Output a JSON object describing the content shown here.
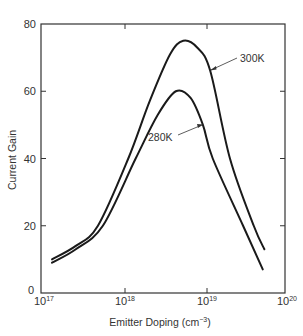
{
  "chart_data": {
    "type": "line",
    "title": "",
    "xlabel": "Emitter Doping (cm⁻³)",
    "xlabel_text": "Emitter Doping (cm",
    "xlabel_sup": "−3",
    "xlabel_close": ")",
    "ylabel": "Current Gain",
    "xscale": "log",
    "xlim": [
      1e+17,
      1e+20
    ],
    "ylim": [
      0,
      80
    ],
    "grid": false,
    "legend": "none (curves labelled by annotation arrows)",
    "x_ticks": [
      {
        "base": "10",
        "exp": "17",
        "value": 1e+17
      },
      {
        "base": "10",
        "exp": "18",
        "value": 1e+18
      },
      {
        "base": "10",
        "exp": "19",
        "value": 1e+19
      },
      {
        "base": "10",
        "exp": "20",
        "value": 1e+20
      }
    ],
    "y_ticks": [
      "0",
      "20",
      "40",
      "60",
      "80"
    ],
    "series": [
      {
        "name": "300K",
        "x_log10": [
          17.11,
          17.4,
          17.67,
          18.04,
          18.3,
          18.55,
          18.71,
          18.88,
          19.04,
          19.28,
          19.57,
          19.7
        ],
        "values": [
          10,
          14,
          20,
          40,
          57,
          71,
          75,
          73,
          66,
          40,
          20,
          13
        ]
      },
      {
        "name": "280K",
        "x_log10": [
          17.11,
          17.4,
          17.73,
          18.13,
          18.4,
          18.62,
          18.8,
          18.95,
          19.07,
          19.44,
          19.68
        ],
        "values": [
          9,
          13,
          20,
          40,
          53,
          60,
          58,
          50,
          40,
          20,
          7
        ]
      }
    ],
    "annotations": [
      {
        "text": "300K",
        "points_to_series": "300K"
      },
      {
        "text": "280K",
        "points_to_series": "280K"
      }
    ]
  },
  "labels": {
    "y_axis": "Current Gain",
    "annot_300": "300K",
    "annot_280": "280K"
  }
}
